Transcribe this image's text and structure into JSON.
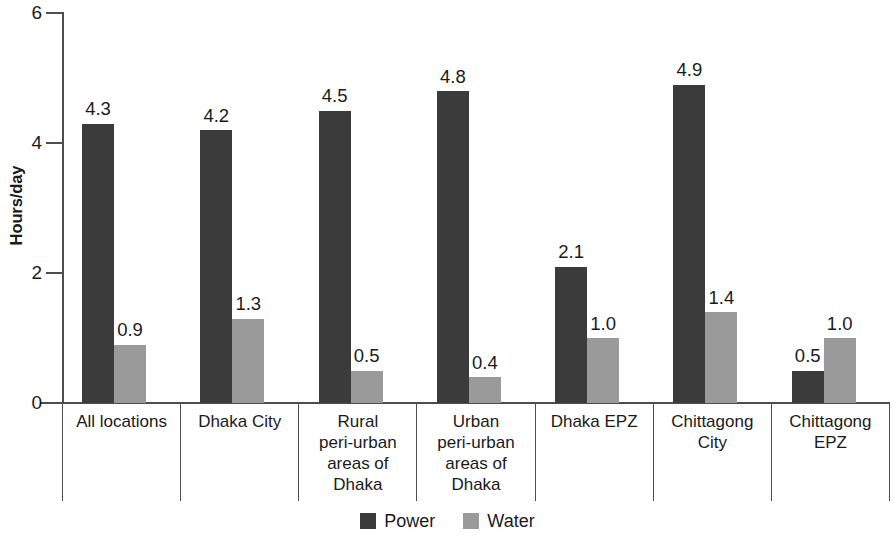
{
  "chart_data": {
    "type": "bar",
    "title": "",
    "xlabel": "",
    "ylabel": "Hours/day",
    "ylim": [
      0,
      6
    ],
    "yticks": [
      "0",
      "2",
      "4",
      "6"
    ],
    "grid": false,
    "legend_position": "bottom-center",
    "categories": [
      "All locations",
      "Dhaka City",
      "Rural peri-urban areas of Dhaka",
      "Urban peri-urban areas of Dhaka",
      "Dhaka EPZ",
      "Chittagong City",
      "Chittagong EPZ"
    ],
    "category_lines": [
      [
        "All locations"
      ],
      [
        "Dhaka City"
      ],
      [
        "Rural",
        "peri-urban",
        "areas of",
        "Dhaka"
      ],
      [
        "Urban",
        "peri-urban",
        "areas of",
        "Dhaka"
      ],
      [
        "Dhaka EPZ"
      ],
      [
        "Chittagong",
        "City"
      ],
      [
        "Chittagong",
        "EPZ"
      ]
    ],
    "series": [
      {
        "name": "Power",
        "color": "#3b3b3b",
        "values": [
          4.3,
          4.2,
          4.5,
          4.8,
          2.1,
          4.9,
          0.5
        ],
        "labels": [
          "4.3",
          "4.2",
          "4.5",
          "4.8",
          "2.1",
          "4.9",
          "0.5"
        ]
      },
      {
        "name": "Water",
        "color": "#9a9a9a",
        "values": [
          0.9,
          1.3,
          0.5,
          0.4,
          1.0,
          1.4,
          1.0
        ],
        "labels": [
          "0.9",
          "1.3",
          "0.5",
          "0.4",
          "1.0",
          "1.4",
          "1.0"
        ]
      }
    ]
  }
}
